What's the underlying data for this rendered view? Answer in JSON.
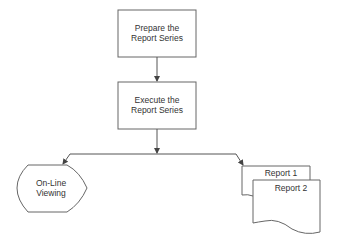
{
  "diagram": {
    "type": "flowchart",
    "nodes": [
      {
        "id": "prepare",
        "shape": "process",
        "label_line1": "Prepare the",
        "label_line2": "Report Series"
      },
      {
        "id": "execute",
        "shape": "process",
        "label_line1": "Execute the",
        "label_line2": "Report Series"
      },
      {
        "id": "online",
        "shape": "display",
        "label_line1": "On-Line",
        "label_line2": "Viewing"
      },
      {
        "id": "report1",
        "shape": "document",
        "label": "Report 1"
      },
      {
        "id": "report2",
        "shape": "document",
        "label": "Report 2"
      }
    ],
    "edges": [
      {
        "from": "prepare",
        "to": "execute"
      },
      {
        "from": "execute",
        "to": "online"
      },
      {
        "from": "execute",
        "to": "report1"
      }
    ],
    "colors": {
      "stroke": "#555555",
      "text": "#333333",
      "background": "#ffffff"
    }
  }
}
